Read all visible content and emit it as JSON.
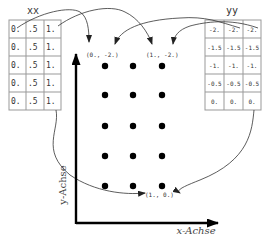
{
  "xx": {
    "label": "xx",
    "rows": [
      [
        "0.",
        ".5",
        "1."
      ],
      [
        "0.",
        ".5",
        "1."
      ],
      [
        "0.",
        ".5",
        "1."
      ],
      [
        "0.",
        ".5",
        "1."
      ],
      [
        "0.",
        ".5",
        "1."
      ]
    ]
  },
  "yy": {
    "label": "yy",
    "rows": [
      [
        "-2.",
        "-2.",
        "-2."
      ],
      [
        "-1.5",
        "-1.5",
        "-1.5"
      ],
      [
        "-1.",
        "-1.",
        "-1."
      ],
      [
        "-0.5",
        "-0.5",
        "-0.5"
      ],
      [
        "0.",
        "0.",
        "0."
      ]
    ]
  },
  "points": {
    "p00": "(0., -2.)",
    "p10": "(1., -2.)",
    "p1y0": "(1., 0.)"
  },
  "axes": {
    "x_label": "x-Achse",
    "y_label": "y-Achse"
  },
  "grid": {
    "cols": 3,
    "rows": 5
  },
  "colors": {
    "line": "#222222",
    "grid": "#888888"
  }
}
